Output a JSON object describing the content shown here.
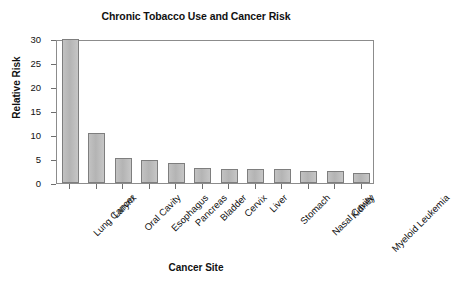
{
  "chart_data": {
    "type": "bar",
    "title": "Chronic Tobacco Use and Cancer Risk",
    "xlabel": "Cancer Site",
    "ylabel": "Relative Risk",
    "ylim": [
      0,
      30
    ],
    "yticks": [
      0,
      5,
      10,
      15,
      20,
      25,
      30
    ],
    "grid": false,
    "legend": "none",
    "bar_color": "#bbbbbb",
    "bar_edge_color": "#7e7e7e",
    "categories": [
      "Lung Cancer",
      "Larynx",
      "Oral Cavity",
      "Esophagus",
      "Pancreas",
      "Bladder",
      "Cervix",
      "Liver",
      "Stomach",
      "Nasal Cavity",
      "Kidney",
      "Myeloid Leukemia"
    ],
    "values": [
      30,
      10.5,
      5.2,
      4.7,
      4.1,
      3.1,
      3.0,
      3.0,
      2.9,
      2.6,
      2.4,
      2.0
    ]
  }
}
